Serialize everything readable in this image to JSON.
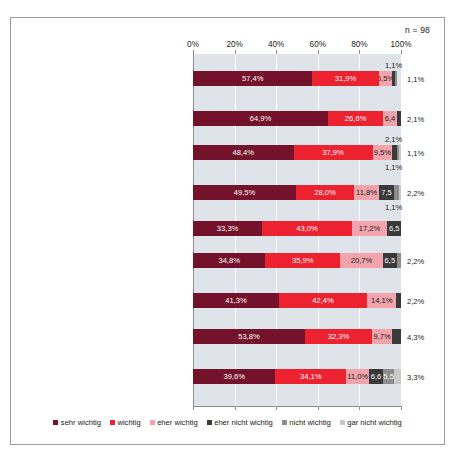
{
  "n_label": "n = 98",
  "axis": {
    "ticks": [
      "0%",
      "20%",
      "40%",
      "60%",
      "80%",
      "100%"
    ],
    "tick_values": [
      0,
      20,
      40,
      60,
      80,
      100
    ]
  },
  "legend": {
    "items": [
      {
        "label": "sehr wichtig",
        "color": "#74122b"
      },
      {
        "label": "wichtig",
        "color": "#ec2230"
      },
      {
        "label": "eher wichtig",
        "color": "#f3a3ab"
      },
      {
        "label": "eher nicht wichtig",
        "color": "#3a3a3a"
      },
      {
        "label": "nicht wichtig",
        "color": "#8c8c8c"
      },
      {
        "label": "gar nicht wichtig",
        "color": "#c9c9c9"
      }
    ]
  },
  "chart_data": {
    "type": "bar",
    "orientation": "horizontal",
    "stacked": true,
    "title": "",
    "subtitle": "",
    "xlabel": "",
    "ylabel": "",
    "xlim": [
      0,
      100
    ],
    "grid": true,
    "legend_position": "bottom",
    "n": 98,
    "series": [
      {
        "name": "sehr wichtig",
        "color": "#74122b",
        "values": [
          57.4,
          64.9,
          48.4,
          49.5,
          33.3,
          34.8,
          41.3,
          53.8,
          39.6
        ]
      },
      {
        "name": "wichtig",
        "color": "#ec2230",
        "values": [
          31.9,
          26.6,
          37.9,
          28.0,
          43.0,
          35.9,
          42.4,
          32.3,
          34.1
        ]
      },
      {
        "name": "eher wichtig",
        "color": "#f3a3ab",
        "values": [
          6.5,
          6.4,
          9.5,
          11.8,
          17.2,
          20.7,
          14.1,
          9.7,
          11.0
        ]
      },
      {
        "name": "eher nicht wichtig",
        "color": "#3a3a3a",
        "values": [
          1.1,
          2.1,
          1.1,
          7.5,
          6.5,
          6.5,
          2.2,
          4.3,
          6.6
        ]
      },
      {
        "name": "nicht wichtig",
        "color": "#8c8c8c",
        "values": [
          1.1,
          0.0,
          2.1,
          2.2,
          0.0,
          2.2,
          0.0,
          0.0,
          5.5
        ]
      },
      {
        "name": "gar nicht wichtig",
        "color": "#c9c9c9",
        "values": [
          0.0,
          0.0,
          1.1,
          1.1,
          0.0,
          0.0,
          0.0,
          0.0,
          3.3
        ]
      }
    ],
    "categories": [
      "Die Bildungsziele werden aus der Unternehmensstrategie und den Unternehmenszielen abgeleitet und zielgruppengerecht operationalisiert.",
      "Die Bildungsbedarfe im Unternehmen werden anhand eines definierten Prozesses einmal jährlich festgestellt/geprüft.",
      "Für jede Stelle/Funktion gibt es ein Stellen- oder Anforderungsprofil.",
      "Gesetzliche Vorgaben zur Aus- und Weiterbildung werden im Bildungsmanagement erfasst und nachgehalten.",
      "Den Stellenprofilen ist ein Kompetenzkatalog hinterlegt.",
      "Kenntnisse und Fähigkeiten der Mitarbeiter sind in individuellen Kompetenzprofilen hinterlegt, unabhängig vom Stellenprofil.",
      "In regelmäßigen Abständen werden Stellenprofile und Mitarbeiterkompetenzen zur Ermittlung des Bildungsbedarfs abgeglichen.",
      "Schlüsselpositionen im Unternehmen werden identifiziert und sind benannt.",
      "Für als besonders wichtig eingestufte Stellen existiert eine schriftlich fixierte Nachfolgeplanung."
    ]
  },
  "rows": [
    {
      "caption_lines": [
        "Die Bildungsziele werden aus der",
        "Unternehmensstrategie und den",
        "Unternehmenszielen abgeleitet und",
        "zielgruppengerecht operationalisiert."
      ],
      "segments": [
        {
          "label": "57,4%",
          "value": 57.4,
          "color": "#74122b",
          "text": "#ffffff",
          "inside": true
        },
        {
          "label": "31,9%",
          "value": 31.9,
          "color": "#ec2230",
          "text": "#ffffff",
          "inside": true
        },
        {
          "label": "6,5%",
          "value": 6.5,
          "color": "#f3a3ab",
          "text": "#1a1a1a",
          "inside": true
        },
        {
          "label": "1,1%",
          "value": 1.1,
          "color": "#3a3a3a",
          "text": "#1a1a1a",
          "inside": false,
          "place": "above"
        },
        {
          "label": "1,1%",
          "value": 1.1,
          "color": "#8c8c8c",
          "text": "#1a1a1a",
          "inside": false,
          "place": "right"
        }
      ]
    },
    {
      "caption_lines": [
        "Die Bildungsbedarfe im Unternehmen",
        "werden anhand eines definierten Pro-",
        "zesses einmal jährlich festgestellt/geprüft."
      ],
      "segments": [
        {
          "label": "64,9%",
          "value": 64.9,
          "color": "#74122b",
          "text": "#ffffff",
          "inside": true
        },
        {
          "label": "26,6%",
          "value": 26.6,
          "color": "#ec2230",
          "text": "#ffffff",
          "inside": true
        },
        {
          "label": "6,4",
          "value": 6.4,
          "color": "#f3a3ab",
          "text": "#1a1a1a",
          "inside": true
        },
        {
          "label": "2,1%",
          "value": 2.1,
          "color": "#3a3a3a",
          "text": "#1a1a1a",
          "inside": false,
          "place": "right"
        }
      ]
    },
    {
      "caption_lines": [
        "Für jede Stelle/Funktion gibt es ein",
        "Stellen- oder Anforderungsprofil."
      ],
      "segments": [
        {
          "label": "48,4%",
          "value": 48.4,
          "color": "#74122b",
          "text": "#ffffff",
          "inside": true
        },
        {
          "label": "37,9%",
          "value": 37.9,
          "color": "#ec2230",
          "text": "#ffffff",
          "inside": true
        },
        {
          "label": "9,5%",
          "value": 9.5,
          "color": "#f3a3ab",
          "text": "#1a1a1a",
          "inside": true
        },
        {
          "label": "2,1%",
          "value": 2.1,
          "color": "#3a3a3a",
          "text": "#1a1a1a",
          "inside": false,
          "place": "above"
        },
        {
          "label": "1,1%",
          "value": 1.1,
          "color": "#8c8c8c",
          "text": "#1a1a1a",
          "inside": false,
          "place": "right"
        },
        {
          "label": "1,1%",
          "value": 1.1,
          "color": "#c9c9c9",
          "text": "#1a1a1a",
          "inside": false,
          "place": "below"
        }
      ]
    },
    {
      "caption_lines": [
        "Gesetzliche Vorgaben zur Aus- und",
        "Weiterbildung werden im Bildungs-",
        "management erfasst und nachgehalten."
      ],
      "segments": [
        {
          "label": "49,5%",
          "value": 49.5,
          "color": "#74122b",
          "text": "#ffffff",
          "inside": true
        },
        {
          "label": "28,0%",
          "value": 28.0,
          "color": "#ec2230",
          "text": "#ffffff",
          "inside": true
        },
        {
          "label": "11,8%",
          "value": 11.8,
          "color": "#f3a3ab",
          "text": "#1a1a1a",
          "inside": true
        },
        {
          "label": "7,5",
          "value": 7.5,
          "color": "#3a3a3a",
          "text": "#ffffff",
          "inside": true
        },
        {
          "label": "2,2%",
          "value": 2.2,
          "color": "#8c8c8c",
          "text": "#1a1a1a",
          "inside": false,
          "place": "right"
        },
        {
          "label": "1,1%",
          "value": 1.1,
          "color": "#c9c9c9",
          "text": "#1a1a1a",
          "inside": false,
          "place": "below"
        }
      ]
    },
    {
      "caption_lines": [
        "Den Stellenprofilen ist ein",
        "Kompetenzkatalog hinterlegt."
      ],
      "segments": [
        {
          "label": "33,3%",
          "value": 33.3,
          "color": "#74122b",
          "text": "#ffffff",
          "inside": true
        },
        {
          "label": "43,0%",
          "value": 43.0,
          "color": "#ec2230",
          "text": "#ffffff",
          "inside": true
        },
        {
          "label": "17,2%",
          "value": 17.2,
          "color": "#f3a3ab",
          "text": "#1a1a1a",
          "inside": true
        },
        {
          "label": "6,5",
          "value": 6.5,
          "color": "#3a3a3a",
          "text": "#ffffff",
          "inside": true
        }
      ]
    },
    {
      "caption_lines": [
        "Kenntnisse und Fähigkeiten der",
        "Mitarbeiter sind in individuellen",
        "Kompetenzprofilen hinterlegt,",
        "unabhängig vom Stellenprofil."
      ],
      "segments": [
        {
          "label": "34,8%",
          "value": 34.8,
          "color": "#74122b",
          "text": "#ffffff",
          "inside": true
        },
        {
          "label": "35,9%",
          "value": 35.9,
          "color": "#ec2230",
          "text": "#ffffff",
          "inside": true
        },
        {
          "label": "20,7%",
          "value": 20.7,
          "color": "#f3a3ab",
          "text": "#1a1a1a",
          "inside": true
        },
        {
          "label": "6,5",
          "value": 6.5,
          "color": "#3a3a3a",
          "text": "#ffffff",
          "inside": true
        },
        {
          "label": "2,2%",
          "value": 2.2,
          "color": "#8c8c8c",
          "text": "#1a1a1a",
          "inside": false,
          "place": "right"
        }
      ]
    },
    {
      "caption_lines": [
        "In regelmäßigen Abständen werden",
        "Stellenprofile und Mitarbeiter-",
        "kompetenzen zur Ermittlung des",
        "Bildungsbedarfs abgeglichen."
      ],
      "segments": [
        {
          "label": "41,3%",
          "value": 41.3,
          "color": "#74122b",
          "text": "#ffffff",
          "inside": true
        },
        {
          "label": "42,4%",
          "value": 42.4,
          "color": "#ec2230",
          "text": "#ffffff",
          "inside": true
        },
        {
          "label": "14,1%",
          "value": 14.1,
          "color": "#f3a3ab",
          "text": "#1a1a1a",
          "inside": true
        },
        {
          "label": "2,2%",
          "value": 2.2,
          "color": "#3a3a3a",
          "text": "#1a1a1a",
          "inside": false,
          "place": "right"
        }
      ]
    },
    {
      "caption_lines": [
        "Schlüsselpositionen im Unternehmen",
        "werden identifiziert und sind benannt."
      ],
      "segments": [
        {
          "label": "53,8%",
          "value": 53.8,
          "color": "#74122b",
          "text": "#ffffff",
          "inside": true
        },
        {
          "label": "32,3%",
          "value": 32.3,
          "color": "#ec2230",
          "text": "#ffffff",
          "inside": true
        },
        {
          "label": "9,7%",
          "value": 9.7,
          "color": "#f3a3ab",
          "text": "#1a1a1a",
          "inside": true
        },
        {
          "label": "4,3%",
          "value": 4.3,
          "color": "#3a3a3a",
          "text": "#1a1a1a",
          "inside": false,
          "place": "right"
        }
      ]
    },
    {
      "caption_lines": [
        "Für als besonders wichtig eingestufte",
        "Stellen existiert eine schriftlich fixierte",
        "Nachfolgeplanung."
      ],
      "segments": [
        {
          "label": "39,6%",
          "value": 39.6,
          "color": "#74122b",
          "text": "#ffffff",
          "inside": true
        },
        {
          "label": "34,1%",
          "value": 34.1,
          "color": "#ec2230",
          "text": "#ffffff",
          "inside": true
        },
        {
          "label": "11,0%",
          "value": 11.0,
          "color": "#f3a3ab",
          "text": "#1a1a1a",
          "inside": true
        },
        {
          "label": "6,6",
          "value": 6.6,
          "color": "#3a3a3a",
          "text": "#ffffff",
          "inside": true
        },
        {
          "label": "5,5",
          "value": 5.5,
          "color": "#8c8c8c",
          "text": "#ffffff",
          "inside": true
        },
        {
          "label": "3,3%",
          "value": 3.3,
          "color": "#c9c9c9",
          "text": "#1a1a1a",
          "inside": false,
          "place": "right"
        }
      ]
    }
  ]
}
